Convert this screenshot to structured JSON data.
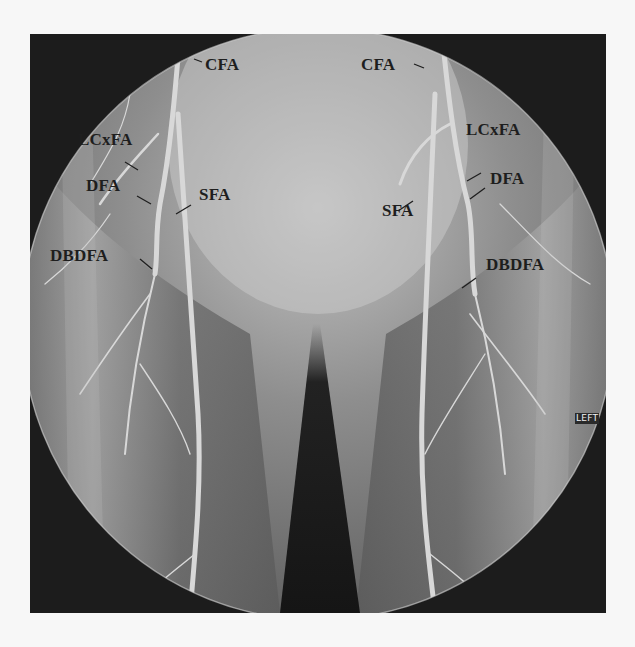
{
  "image": {
    "type": "angiography",
    "orientation_marker": "LEFT"
  },
  "labels": {
    "right_side": {
      "cfa": "CFA",
      "lcxfa": "LCxFA",
      "dfa": "DFA",
      "sfa": "SFA",
      "dbdfa": "DBDFA"
    },
    "left_side": {
      "cfa": "CFA",
      "lcxfa": "LCxFA",
      "dfa": "DFA",
      "sfa": "SFA",
      "dbdfa": "DBDFA"
    }
  },
  "colors": {
    "page_background": "#f7f7f7",
    "frame_background": "#1c1c1c",
    "field_light": "#b8b8b8",
    "field_dark": "#6a6a6a",
    "vessel": "#d6d6d6",
    "label_text": "#1e1e1e",
    "marker_text": "#f2f2f2"
  }
}
